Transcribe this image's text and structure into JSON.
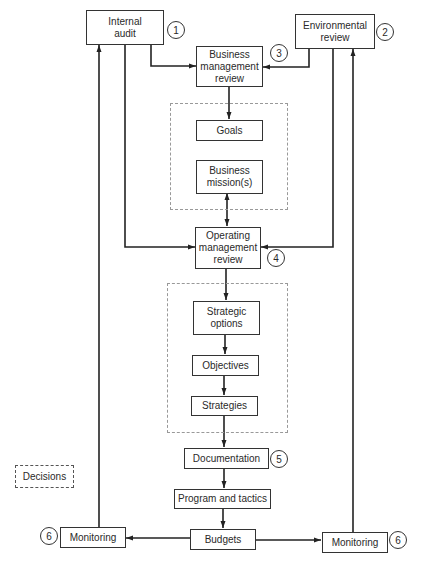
{
  "diagram": {
    "nodes": {
      "internal_audit": {
        "label": "Internal\naudit",
        "step": "1"
      },
      "environmental_review": {
        "label": "Environmental\nreview",
        "step": "2"
      },
      "business_management_review": {
        "label": "Business\nmanagement\nreview",
        "step": "3"
      },
      "goals": {
        "label": "Goals"
      },
      "business_missions": {
        "label": "Business\nmission(s)"
      },
      "operating_management_review": {
        "label": "Operating\nmanagement\nreview",
        "step": "4"
      },
      "strategic_options": {
        "label": "Strategic\noptions"
      },
      "objectives": {
        "label": "Objectives"
      },
      "strategies": {
        "label": "Strategies"
      },
      "documentation": {
        "label": "Documentation",
        "step": "5"
      },
      "program_and_tactics": {
        "label": "Program and tactics"
      },
      "budgets": {
        "label": "Budgets"
      },
      "monitoring_left": {
        "label": "Monitoring",
        "step": "6"
      },
      "monitoring_right": {
        "label": "Monitoring",
        "step": "6"
      }
    },
    "legend": {
      "decisions": "Decisions"
    },
    "edges": [
      {
        "from": "internal_audit",
        "to": "business_management_review"
      },
      {
        "from": "environmental_review",
        "to": "business_management_review"
      },
      {
        "from": "business_management_review",
        "to": "goals"
      },
      {
        "from": "business_missions",
        "to": "operating_management_review",
        "bidirectional": true
      },
      {
        "from": "internal_audit",
        "to": "operating_management_review"
      },
      {
        "from": "environmental_review",
        "to": "operating_management_review"
      },
      {
        "from": "operating_management_review",
        "to": "strategic_options"
      },
      {
        "from": "strategic_options",
        "to": "objectives"
      },
      {
        "from": "objectives",
        "to": "strategies"
      },
      {
        "from": "strategies",
        "to": "documentation"
      },
      {
        "from": "documentation",
        "to": "program_and_tactics"
      },
      {
        "from": "program_and_tactics",
        "to": "budgets"
      },
      {
        "from": "budgets",
        "to": "monitoring_left"
      },
      {
        "from": "budgets",
        "to": "monitoring_right"
      },
      {
        "from": "monitoring_left",
        "to": "internal_audit"
      },
      {
        "from": "monitoring_right",
        "to": "environmental_review"
      }
    ]
  }
}
